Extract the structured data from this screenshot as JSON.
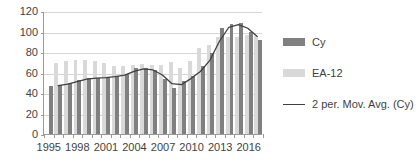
{
  "chart_data": {
    "type": "bar",
    "title": "",
    "xlabel": "",
    "ylabel": "",
    "ylim": [
      0,
      120
    ],
    "ytick_step": 20,
    "yticks": [
      0,
      20,
      40,
      60,
      80,
      100,
      120
    ],
    "grid": true,
    "legend_position": "right",
    "categories": [
      "1995",
      "1996",
      "1997",
      "1998",
      "1999",
      "2000",
      "2001",
      "2002",
      "2003",
      "2004",
      "2005",
      "2006",
      "2007",
      "2008",
      "2009",
      "2010",
      "2011",
      "2012",
      "2013",
      "2014",
      "2015",
      "2016",
      "2017"
    ],
    "xtick_labels": [
      "1995",
      "1998",
      "2001",
      "2004",
      "2007",
      "2010",
      "2013",
      "2016"
    ],
    "series": [
      {
        "name": "Cy",
        "type": "bar",
        "color": "#808080",
        "values": [
          47,
          48,
          50,
          53,
          55,
          55,
          56,
          57,
          59,
          64,
          64,
          62,
          54,
          45,
          52,
          57,
          66,
          79,
          103,
          107,
          108,
          100,
          92
        ]
      },
      {
        "name": "EA-12",
        "type": "bar",
        "color": "#d9d9d9",
        "values": [
          null,
          69,
          71,
          72,
          72,
          71,
          69,
          66,
          66,
          67,
          68,
          67,
          67,
          70,
          64,
          71,
          84,
          87,
          95,
          95,
          95,
          97,
          96
        ]
      },
      {
        "name": "2 per. Mov. Avg. (Cy)",
        "type": "line",
        "color": "#3f3f3f",
        "values": [
          null,
          47.5,
          49,
          51.5,
          54,
          55,
          55.5,
          56.5,
          58,
          61.5,
          64,
          63,
          58,
          49.5,
          48.5,
          54.5,
          61.5,
          72.5,
          91,
          105,
          107.5,
          104,
          96
        ]
      }
    ]
  },
  "legend": {
    "items": [
      {
        "label": "Cy",
        "marker": "bar-swatch-dark"
      },
      {
        "label": "EA-12",
        "marker": "bar-swatch-light"
      },
      {
        "label": "2 per. Mov. Avg. (Cy)",
        "marker": "line-swatch"
      }
    ]
  }
}
